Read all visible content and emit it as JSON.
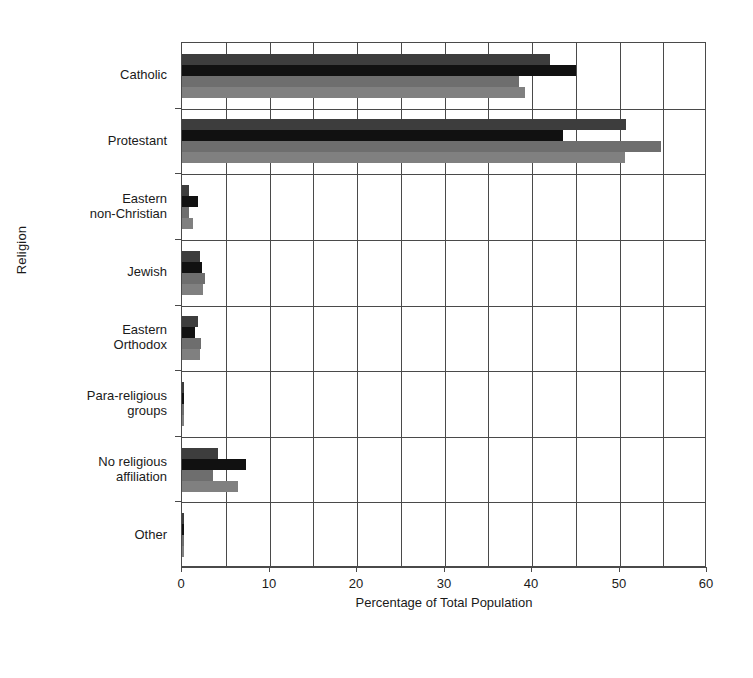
{
  "chart_data": {
    "type": "bar",
    "orientation": "horizontal",
    "title": "",
    "xlabel": "Percentage of Total Population",
    "ylabel": "Religion",
    "xlim": [
      0,
      60
    ],
    "xticks": [
      0,
      10,
      20,
      30,
      40,
      50,
      60
    ],
    "xtick_labels": [
      "0",
      "10",
      "20",
      "30",
      "40",
      "50",
      "60"
    ],
    "minor_gridlines": true,
    "grid": true,
    "legend": "none",
    "categories": [
      "Catholic",
      "Eastern\nnon-Christian",
      "Protestant",
      "Jewish",
      "Eastern\nOrthodox",
      "Para-religious\ngroups",
      "No religious\naffiliation",
      "Other"
    ],
    "category_order": [
      "Catholic",
      "Protestant",
      "Eastern\nnon-Christian",
      "Jewish",
      "Eastern\nOrthodox",
      "Para-religious\ngroups",
      "No religious\naffiliation",
      "Other"
    ],
    "series": [
      {
        "name": "series-1",
        "color": "#3d3d3d",
        "values": [
          42.0,
          50.7,
          0.8,
          2.0,
          1.8,
          0.2,
          4.1,
          0.2
        ]
      },
      {
        "name": "series-2",
        "color": "#111111",
        "values": [
          45.0,
          43.5,
          1.8,
          2.3,
          1.5,
          0.2,
          7.3,
          0.2
        ]
      },
      {
        "name": "series-3",
        "color": "#6e6e6e",
        "values": [
          38.5,
          54.7,
          0.8,
          2.6,
          2.2,
          0.2,
          3.5,
          0.2
        ]
      },
      {
        "name": "series-4",
        "color": "#808080",
        "values": [
          39.2,
          50.6,
          1.3,
          2.4,
          2.0,
          0.2,
          6.4,
          0.2
        ]
      }
    ]
  }
}
